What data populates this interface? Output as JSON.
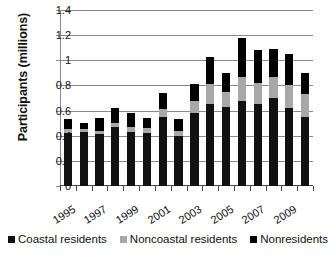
{
  "chart_data": {
    "type": "bar",
    "subtype": "stacked-bar",
    "title": "",
    "xlabel": "",
    "ylabel": "Participants (millions)",
    "ylim": [
      0,
      1.4
    ],
    "ytick_labels": [
      "0",
      "0.2",
      "0.4",
      "0.6",
      "0.8",
      "1",
      "1.2",
      "1.4"
    ],
    "ytick_values": [
      0,
      0.2,
      0.4,
      0.6,
      0.8,
      1,
      1.2,
      1.4
    ],
    "grid": true,
    "legend_position": "bottom",
    "categories": [
      "1994",
      "1995",
      "1996",
      "1997",
      "1998",
      "1999",
      "2000",
      "2001",
      "2002",
      "2003",
      "2004",
      "2005",
      "2006",
      "2007",
      "2008",
      "2009"
    ],
    "visible_tick_labels": [
      "1995",
      "1997",
      "1999",
      "2001",
      "2003",
      "2005",
      "2007",
      "2009"
    ],
    "series": [
      {
        "name": "Coastal residents",
        "color": "#111111",
        "values": [
          0.42,
          0.43,
          0.41,
          0.47,
          0.43,
          0.42,
          0.55,
          0.4,
          0.58,
          0.65,
          0.63,
          0.68,
          0.65,
          0.7,
          0.62,
          0.55
        ]
      },
      {
        "name": "Noncoastal residents",
        "color": "#a8a8a8",
        "values": [
          0.03,
          0.02,
          0.03,
          0.03,
          0.04,
          0.04,
          0.06,
          0.04,
          0.1,
          0.16,
          0.12,
          0.19,
          0.17,
          0.17,
          0.18,
          0.18
        ]
      },
      {
        "name": "Nonresidents",
        "color": "#000000",
        "values": [
          0.08,
          0.05,
          0.1,
          0.12,
          0.11,
          0.08,
          0.13,
          0.09,
          0.13,
          0.22,
          0.15,
          0.31,
          0.26,
          0.22,
          0.25,
          0.17
        ]
      }
    ],
    "totals": [
      0.53,
      0.5,
      0.54,
      0.62,
      0.58,
      0.54,
      0.74,
      0.53,
      0.81,
      1.03,
      0.9,
      1.18,
      1.08,
      1.09,
      1.05,
      0.9
    ]
  },
  "legend": {
    "items": [
      {
        "label": "Coastal residents",
        "swatch": "coastal-swatch"
      },
      {
        "label": "Noncoastal residents",
        "swatch": "noncoastal-swatch"
      },
      {
        "label": "Nonresidents",
        "swatch": "nonresidents-swatch"
      }
    ]
  }
}
